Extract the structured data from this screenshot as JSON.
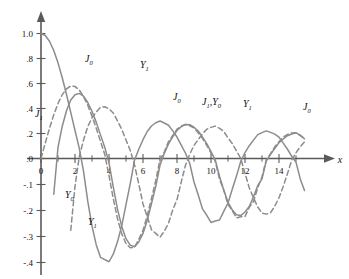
{
  "chart_data": {
    "type": "line",
    "title": "",
    "xlabel": "x",
    "ylabel": "",
    "grid": false,
    "legend": "inline-annotations",
    "xlim": [
      -0.6,
      15.6
    ],
    "ylim": [
      -0.4,
      1.05
    ],
    "x_ticks_major": [
      0,
      2,
      4,
      6,
      8,
      10,
      12,
      14
    ],
    "x_tick_labels": [
      "0",
      "2",
      "4",
      "6",
      "8",
      "10",
      "12",
      "14"
    ],
    "x_ticks_minor": [
      1,
      3,
      5,
      7,
      9,
      11,
      13,
      15
    ],
    "y_ticks": [
      1.0,
      0.8,
      0.6,
      0.4,
      0.2,
      0.0,
      -0.1,
      -0.2,
      -0.3,
      -0.4
    ],
    "y_tick_labels": [
      "1.0",
      ".8",
      ".6",
      ".4",
      ".2",
      ".0",
      "-.1",
      "-.2",
      "-.3",
      "-.4"
    ],
    "axis_note": "y-axis nonuniform: 0.2 steps above 0, 0.1 steps below 0",
    "curve_color": "#8c8c8c",
    "axis_color": "#5a5a5a",
    "series": [
      {
        "name": "J0",
        "style": "solid",
        "label": "J",
        "sublabel": "0",
        "x": [
          0,
          0.25,
          0.5,
          0.75,
          1,
          1.25,
          1.5,
          1.75,
          2,
          2.25,
          2.5,
          2.75,
          3,
          3.25,
          3.5,
          3.75,
          4,
          4.25,
          4.5,
          4.75,
          5,
          5.25,
          5.5,
          5.75,
          6,
          6.25,
          6.5,
          6.75,
          7,
          7.25,
          7.5,
          7.75,
          8,
          8.25,
          8.5,
          8.75,
          9,
          9.25,
          9.5,
          9.75,
          10,
          10.25,
          10.5,
          10.75,
          11,
          11.25,
          11.5,
          11.75,
          12,
          12.25,
          12.5,
          12.75,
          13,
          13.25,
          13.5,
          13.75,
          14,
          14.25,
          14.5,
          14.75,
          15,
          15.25,
          15.5
        ],
        "y": [
          1.0,
          0.9844,
          0.9385,
          0.8642,
          0.7652,
          0.6459,
          0.5118,
          0.369,
          0.2239,
          0.0827,
          -0.0484,
          -0.1641,
          -0.2601,
          -0.3325,
          -0.3801,
          -0.4026,
          -0.3971,
          -0.368,
          -0.3205,
          -0.2578,
          -0.1776,
          -0.0968,
          -0.0068,
          0.074,
          0.1506,
          0.2159,
          0.2601,
          0.286,
          0.3001,
          0.2838,
          0.2663,
          0.2211,
          0.1717,
          0.1076,
          0.0419,
          -0.0194,
          -0.0903,
          -0.1404,
          -0.1939,
          -0.2183,
          -0.2459,
          -0.2404,
          -0.2366,
          -0.2035,
          -0.1712,
          -0.118,
          -0.0677,
          -0.0105,
          0.0477,
          0.1026,
          0.1469,
          0.1912,
          0.2069,
          0.2209,
          0.2087,
          0.1947,
          0.1711,
          0.1227,
          0.0739,
          0.0175,
          -0.0142,
          -0.0786,
          -0.123
        ]
      },
      {
        "name": "J1",
        "style": "dashed",
        "label": "J",
        "sublabel": "1",
        "x": [
          0,
          0.25,
          0.5,
          0.75,
          1,
          1.25,
          1.5,
          1.75,
          2,
          2.25,
          2.5,
          2.75,
          3,
          3.25,
          3.5,
          3.75,
          4,
          4.25,
          4.5,
          4.75,
          5,
          5.25,
          5.5,
          5.75,
          6,
          6.25,
          6.5,
          6.75,
          7,
          7.25,
          7.5,
          7.75,
          8,
          8.25,
          8.5,
          8.75,
          9,
          9.25,
          9.5,
          9.75,
          10,
          10.25,
          10.5,
          10.75,
          11,
          11.25,
          11.5,
          11.75,
          12,
          12.25,
          12.5,
          12.75,
          13,
          13.25,
          13.5,
          13.75,
          14,
          14.25,
          14.5,
          14.75,
          15,
          15.25,
          15.5
        ],
        "y": [
          0.0,
          0.124,
          0.2423,
          0.3492,
          0.4401,
          0.5106,
          0.5579,
          0.5802,
          0.5767,
          0.5484,
          0.4971,
          0.4258,
          0.3391,
          0.2413,
          0.1374,
          0.0328,
          -0.066,
          -0.1538,
          -0.2311,
          -0.2898,
          -0.3276,
          -0.3432,
          -0.3414,
          -0.311,
          -0.2767,
          -0.2196,
          -0.1538,
          -0.0845,
          -0.0047,
          0.052,
          0.1352,
          0.1841,
          0.2346,
          0.259,
          0.2731,
          0.2614,
          0.2453,
          0.2043,
          0.1613,
          0.1052,
          0.0435,
          -0.0106,
          -0.0789,
          -0.1214,
          -0.1768,
          -0.2008,
          -0.2284,
          -0.2237,
          -0.2234,
          -0.1879,
          -0.1655,
          -0.1122,
          -0.0703,
          -0.0053,
          0.038,
          0.0937,
          0.1334,
          0.1715,
          0.1927,
          0.2041,
          0.2051,
          0.1824,
          0.1587
        ]
      },
      {
        "name": "Y0",
        "style": "solid",
        "label": "Y",
        "sublabel": "0",
        "x": [
          0.1,
          0.25,
          0.5,
          0.75,
          1,
          1.25,
          1.5,
          1.75,
          2,
          2.25,
          2.5,
          2.75,
          3,
          3.25,
          3.5,
          3.75,
          4,
          4.25,
          4.5,
          4.75,
          5,
          5.25,
          5.5,
          5.75,
          6,
          6.25,
          6.5,
          6.75,
          7,
          7.25,
          7.5,
          7.75,
          8,
          8.25,
          8.5,
          8.75,
          9,
          9.25,
          9.5,
          9.75,
          10,
          10.25,
          10.5,
          10.75,
          11,
          11.25,
          11.5,
          11.75,
          12,
          12.25,
          12.5,
          12.75,
          13,
          13.25,
          13.5,
          13.75,
          14,
          14.25,
          14.5,
          14.75,
          15,
          15.25,
          15.5
        ],
        "y": [
          -1.534,
          -0.9316,
          -0.4445,
          -0.1373,
          0.0883,
          0.2582,
          0.3824,
          0.4682,
          0.5104,
          0.5208,
          0.4981,
          0.4481,
          0.3769,
          0.289,
          0.189,
          0.0896,
          -0.0169,
          -0.1091,
          -0.1947,
          -0.2612,
          -0.3085,
          -0.3332,
          -0.3395,
          -0.321,
          -0.2882,
          -0.2374,
          -0.1732,
          -0.1072,
          -0.0259,
          0.0413,
          0.1173,
          0.1726,
          0.2235,
          0.2549,
          0.272,
          0.2699,
          0.2499,
          0.2204,
          0.1712,
          0.1185,
          0.0557,
          -0.0058,
          -0.0681,
          -0.1209,
          -0.1688,
          -0.1977,
          -0.2163,
          -0.2195,
          -0.2057,
          -0.1846,
          -0.1475,
          -0.1042,
          -0.0782,
          -0.0098,
          0.0326,
          0.0804,
          0.1272,
          0.1562,
          0.1822,
          0.1959,
          0.2055,
          0.1864,
          0.1583
        ]
      },
      {
        "name": "Y1",
        "style": "dashed",
        "label": "Y",
        "sublabel": "1",
        "x": [
          0.4,
          0.5,
          0.75,
          1,
          1.25,
          1.5,
          1.75,
          2,
          2.25,
          2.5,
          2.75,
          3,
          3.25,
          3.5,
          3.75,
          4,
          4.25,
          4.5,
          4.75,
          5,
          5.25,
          5.5,
          5.75,
          6,
          6.25,
          6.5,
          6.75,
          7,
          7.25,
          7.5,
          7.75,
          8,
          8.25,
          8.5,
          8.75,
          9,
          9.25,
          9.5,
          9.75,
          10,
          10.25,
          10.5,
          10.75,
          11,
          11.25,
          11.5,
          11.75,
          12,
          12.25,
          12.5,
          12.75,
          13,
          13.25,
          13.5,
          13.75,
          14,
          14.25,
          14.5,
          14.75,
          15,
          15.25,
          15.5
        ],
        "y": [
          -1.781,
          -1.471,
          -1.038,
          -0.7812,
          -0.6211,
          -0.4123,
          -0.276,
          -0.107,
          0.0152,
          0.1459,
          0.2556,
          0.3247,
          0.3707,
          0.4102,
          0.4141,
          0.3979,
          0.3643,
          0.301,
          0.2331,
          0.1479,
          0.0646,
          -0.0238,
          -0.0977,
          -0.175,
          -0.2243,
          -0.2741,
          -0.288,
          -0.3027,
          -0.2801,
          -0.249,
          -0.1978,
          -0.1581,
          -0.0899,
          -0.0262,
          0.035,
          0.1043,
          0.1523,
          0.1973,
          0.2338,
          0.249,
          0.2591,
          0.2412,
          0.2167,
          0.1637,
          0.12,
          0.0614,
          0.0004,
          -0.0571,
          -0.1125,
          -0.1509,
          -0.1866,
          -0.2101,
          -0.2139,
          -0.209,
          -0.1836,
          -0.1508,
          -0.1074,
          -0.0581,
          -0.0058,
          0.0462,
          0.094,
          0.1343
        ]
      }
    ],
    "annotations": [
      {
        "id": "ann-j0-1",
        "label": "J",
        "sub": "0",
        "x_px": 85,
        "y_px": 62
      },
      {
        "id": "ann-y1-1",
        "label": "Y",
        "sub": "1",
        "x_px": 140,
        "y_px": 68
      },
      {
        "id": "ann-j1-1",
        "label": "J",
        "sub": "1",
        "x_px": 35,
        "y_px": 117
      },
      {
        "id": "ann-j0-2",
        "label": "J",
        "sub": "0",
        "x_px": 173,
        "y_px": 100
      },
      {
        "id": "ann-j1y0",
        "label": "J",
        "sub": "1",
        "label2": "Y",
        "sub2": "0",
        "x_px": 202,
        "y_px": 105
      },
      {
        "id": "ann-y1-2",
        "label": "Y",
        "sub": "1",
        "x_px": 243,
        "y_px": 107
      },
      {
        "id": "ann-j0-3",
        "label": "J",
        "sub": "0",
        "x_px": 303,
        "y_px": 110
      },
      {
        "id": "ann-y0-1",
        "label": "Y",
        "sub": "0",
        "x_px": 65,
        "y_px": 198
      },
      {
        "id": "ann-y1-3",
        "label": "Y",
        "sub": "1",
        "x_px": 88,
        "y_px": 225
      }
    ]
  },
  "axis": {
    "x_axis_label": "x"
  }
}
